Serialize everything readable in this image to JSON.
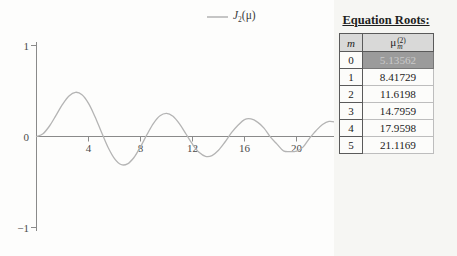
{
  "figure": {
    "legend": {
      "symbol": "J",
      "sub": "2",
      "arg": "(μ)"
    }
  },
  "chart_data": {
    "type": "line",
    "title": "",
    "legend_label": "J_2(μ)",
    "legend_position": "top",
    "grid": false,
    "xlim": [
      0,
      23
    ],
    "ylim": [
      -1,
      1
    ],
    "x_ticks": [
      4,
      8,
      12,
      16,
      20
    ],
    "y_tick_marks": [
      1,
      -1
    ],
    "y_labels": [
      {
        "v": 1,
        "t": "1"
      },
      {
        "v": 0,
        "t": "0"
      },
      {
        "v": -1,
        "t": "−1"
      }
    ],
    "line_color": "#b4b4b4",
    "axis_color": "#8a8a8a",
    "series": [
      {
        "name": "J_2(μ)",
        "x": [
          0,
          0.5,
          1,
          1.5,
          2,
          2.5,
          3,
          3.5,
          4,
          4.5,
          5,
          5.5,
          6,
          6.5,
          7,
          7.5,
          8,
          8.5,
          9,
          9.5,
          10,
          10.5,
          11,
          11.5,
          12,
          12.5,
          13,
          13.5,
          14,
          14.5,
          15,
          15.5,
          16,
          16.5,
          17,
          17.5,
          18,
          18.5,
          19,
          19.5,
          20,
          20.5,
          21,
          21.5,
          22,
          22.5,
          23
        ],
        "y": [
          0,
          0.0306,
          0.1149,
          0.2321,
          0.3528,
          0.4461,
          0.4861,
          0.4586,
          0.3641,
          0.2178,
          0.0466,
          -0.1173,
          -0.2429,
          -0.3074,
          -0.3014,
          -0.2303,
          -0.113,
          0.0223,
          0.1448,
          0.2279,
          0.2546,
          0.2216,
          0.139,
          0.028,
          -0.0849,
          -0.1734,
          -0.2177,
          -0.2094,
          -0.152,
          -0.0608,
          0.0416,
          0.1231,
          0.1862,
          0.1935,
          0.1584,
          0.092,
          -0.0075,
          -0.0834,
          -0.1577,
          -0.1667,
          -0.1603,
          -0.1168,
          -0.0203,
          0.064,
          0.1314,
          0.1661,
          0.159
        ]
      }
    ],
    "roots": [
      5.13562,
      8.41729,
      11.6198,
      14.7959,
      17.9598,
      21.1169
    ]
  },
  "roots_table": {
    "title": "Equation Roots:",
    "col_m": "m",
    "col_mu": {
      "base": "μ",
      "sup": "(2)",
      "sub": "m"
    },
    "rows": [
      {
        "m": "0",
        "value": "5.13562"
      },
      {
        "m": "1",
        "value": "8.41729"
      },
      {
        "m": "2",
        "value": "11.6198"
      },
      {
        "m": "3",
        "value": "14.7959"
      },
      {
        "m": "4",
        "value": "17.9598"
      },
      {
        "m": "5",
        "value": "21.1169"
      }
    ]
  }
}
